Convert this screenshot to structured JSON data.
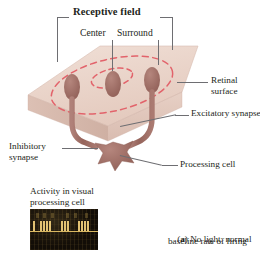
{
  "figure": {
    "title": "Receptive field",
    "labels": {
      "center": "Center",
      "surround": "Surround",
      "retinal_surface_line1": "Retinal",
      "retinal_surface_line2": "surface",
      "excitatory_synapse": "Excitatory synapse",
      "inhibitory_synapse_line1": "Inhibitory",
      "inhibitory_synapse_line2": "synapse",
      "processing_cell": "Processing cell",
      "activity_line1": "Activity in visual",
      "activity_line2": "processing cell"
    },
    "caption": {
      "marker": "a",
      "prefix": "(",
      "suffix": ")",
      "line1": " No light: normal",
      "line2": "baseline rate of firing"
    },
    "colors": {
      "receptive_field_outline": "#e2636b",
      "retina_top": "#ecd9cf",
      "retina_side": "#dcc0b4",
      "retina_front": "#e6cec3",
      "neuron": "#9d6b62",
      "axon": "#c59c95",
      "leader_line": "#6e6e72",
      "scope_background": "#120d07",
      "scope_trace": "#d9b861",
      "text": "#231f20"
    },
    "chart_data": {
      "type": "raster",
      "title": "Activity in visual processing cell",
      "ylabel": "",
      "xlabel": "time",
      "description": "Spike train showing normal baseline rate of firing with no light",
      "spike_positions": [
        3,
        10,
        13,
        16,
        19,
        31,
        34,
        37,
        48,
        51,
        54,
        57
      ],
      "spike_height": 10,
      "baseline_y": 22
    }
  }
}
